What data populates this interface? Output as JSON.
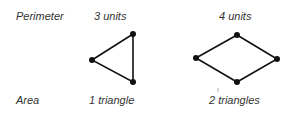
{
  "row_labels": {
    "perimeter": "Perimeter",
    "area": "Area"
  },
  "shapes": [
    {
      "name": "triangle",
      "perimeter": "3 units",
      "area": "1 triangle",
      "vertices": [
        [
          92,
          60
        ],
        [
          133,
          34
        ],
        [
          133,
          82
        ]
      ]
    },
    {
      "name": "rhombus",
      "perimeter": "4 units",
      "area": "2 triangles",
      "vertices": [
        [
          196,
          58
        ],
        [
          237,
          35
        ],
        [
          277,
          59
        ],
        [
          237,
          82
        ]
      ]
    }
  ],
  "colors": {
    "line": "#111111",
    "text": "#333333"
  }
}
